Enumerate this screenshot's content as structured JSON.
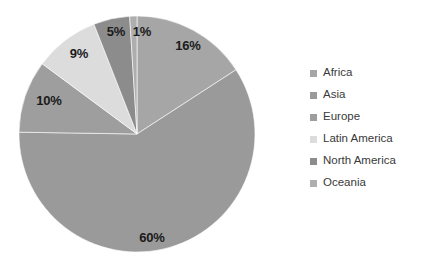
{
  "chart_data": {
    "type": "pie",
    "title": "",
    "subtitle": "",
    "xlabel": "",
    "ylabel": "",
    "legend_position": "right",
    "grid": false,
    "start_angle_deg": 0,
    "direction": "clockwise",
    "units": "percent",
    "categories": [
      "Africa",
      "Asia",
      "Europe",
      "Latin America",
      "North America",
      "Oceania"
    ],
    "values": [
      16,
      60,
      10,
      9,
      5,
      1
    ],
    "data_labels": [
      "16%",
      "60%",
      "10%",
      "9%",
      "5%",
      "1%"
    ],
    "colors": [
      "#a6a6a6",
      "#9a9a9a",
      "#9e9e9e",
      "#dcdcdc",
      "#8c8c8c",
      "#aeaeae"
    ],
    "slices": [
      {
        "name": "Africa",
        "value": 16,
        "label": "16%",
        "color": "#a6a6a6",
        "label_x": 188,
        "label_y": 45
      },
      {
        "name": "Asia",
        "value": 60,
        "label": "60%",
        "color": "#9a9a9a",
        "label_x": 152,
        "label_y": 237
      },
      {
        "name": "Europe",
        "value": 10,
        "label": "10%",
        "color": "#9e9e9e",
        "label_x": 49,
        "label_y": 100
      },
      {
        "name": "Latin America",
        "value": 9,
        "label": "9%",
        "color": "#dcdcdc",
        "label_x": 79,
        "label_y": 53
      },
      {
        "name": "North America",
        "value": 5,
        "label": "5%",
        "color": "#8c8c8c",
        "label_x": 116,
        "label_y": 31
      },
      {
        "name": "Oceania",
        "value": 1,
        "label": "1%",
        "color": "#aeaeae",
        "label_x": 142,
        "label_y": 31
      }
    ]
  },
  "legend": {
    "items": [
      {
        "label": "Africa",
        "color": "#a6a6a6"
      },
      {
        "label": "Asia",
        "color": "#9a9a9a"
      },
      {
        "label": "Europe",
        "color": "#9e9e9e"
      },
      {
        "label": "Latin America",
        "color": "#dcdcdc"
      },
      {
        "label": "North America",
        "color": "#8c8c8c"
      },
      {
        "label": "Oceania",
        "color": "#aeaeae"
      }
    ]
  },
  "geometry": {
    "center_x": 137,
    "center_y": 134,
    "radius": 118
  },
  "background_color": "#ffffff"
}
